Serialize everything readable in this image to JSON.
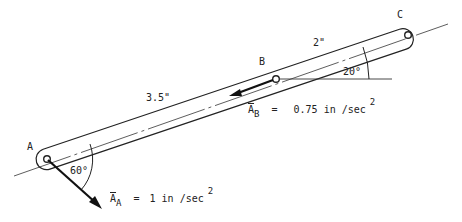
{
  "diagram": {
    "points": {
      "A": {
        "label": "A"
      },
      "B": {
        "label": "B"
      },
      "C": {
        "label": "C"
      }
    },
    "dimensions": {
      "AB": "3.5\"",
      "BC": "2\""
    },
    "angles": {
      "at_A": "60°",
      "at_B": "20°"
    },
    "accelerations": {
      "A": {
        "symbol": "A",
        "subscript": "A",
        "equals": "=",
        "value": "1 in /sec",
        "exponent": "2"
      },
      "B": {
        "symbol": "A",
        "subscript": "B",
        "equals": "=",
        "value": "0.75 in /sec",
        "exponent": "2"
      }
    },
    "colors": {
      "ink": "#222222",
      "background": "#ffffff"
    }
  }
}
